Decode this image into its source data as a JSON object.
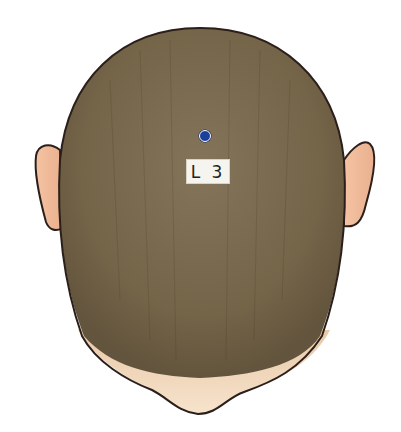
{
  "figure": {
    "view": "top of head (posterior-superior view)",
    "point": {
      "label": "L 3",
      "marker_color": "#1c3f9a"
    },
    "colors": {
      "hair": "#7a6a50",
      "skin": "#f2c4a6",
      "outline": "#2a1f1a",
      "background": "#ffffff"
    }
  }
}
